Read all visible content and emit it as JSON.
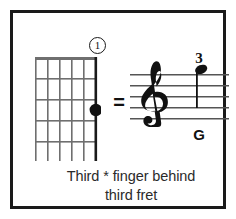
{
  "card": {
    "border_color": "#1a1a1a",
    "background_color": "#ffffff"
  },
  "chord_diagram": {
    "name": "guitar-fretboard-diagram",
    "strings": 6,
    "frets": 5,
    "nut_shown": true,
    "thick_string_index": 6,
    "fret_marker_badge": {
      "label": "1",
      "shape": "circle"
    },
    "finger_dots": [
      {
        "string": 6,
        "fret": 3,
        "label": ""
      }
    ]
  },
  "equals": {
    "symbol": "="
  },
  "notation": {
    "clef": "treble",
    "staff_lines": 5,
    "note": {
      "head": "filled",
      "stem": "down",
      "finger_number": "3",
      "pitch_name": "G"
    }
  },
  "caption": {
    "line1": "Third * finger behind",
    "line2": "third fret"
  },
  "colors": {
    "ink": "#111111",
    "grid": "#6f6f6f",
    "caption": "#2b2b2b"
  }
}
